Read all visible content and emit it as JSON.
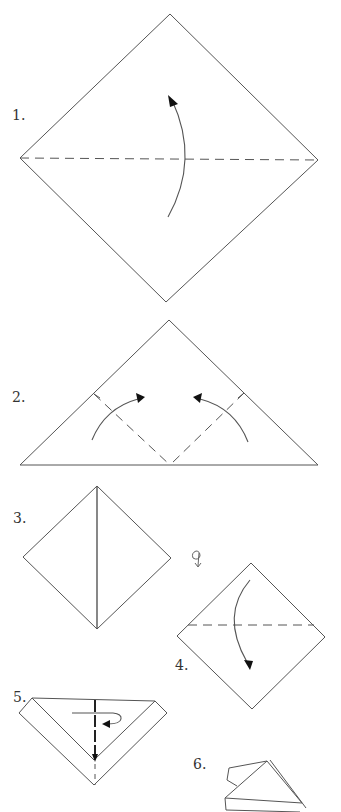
{
  "diagram": {
    "type": "origami-instructions",
    "colors": {
      "line": "#555555",
      "arrowhead": "#111111",
      "background": "#ffffff"
    },
    "steps": [
      {
        "number": "1.",
        "shape": "square-diamond",
        "fold": "valley fold horizontal diagonal, fold bottom up"
      },
      {
        "number": "2.",
        "shape": "triangle",
        "fold": "valley fold both bottom corners up to apex"
      },
      {
        "number": "3.",
        "shape": "diamond",
        "fold": "center crease; turn over"
      },
      {
        "number": "4.",
        "shape": "diamond",
        "fold": "valley fold top corner down"
      },
      {
        "number": "5.",
        "shape": "folded-v",
        "fold": "valley fold in half, fold behind"
      },
      {
        "number": "6.",
        "shape": "finished-model",
        "fold": "result"
      }
    ],
    "symbols": {
      "turn_over": "turn-over-icon"
    }
  }
}
